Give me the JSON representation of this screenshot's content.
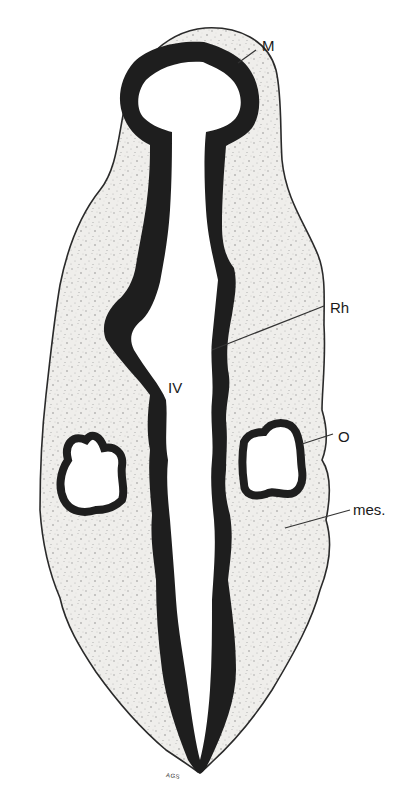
{
  "figure": {
    "type": "anatomical-diagram",
    "colors": {
      "background": "#ffffff",
      "mesenchyme_fill": "#ecebe8",
      "mesenchyme_speckle": "#9a9a9a",
      "neural_wall": "#1e1e1e",
      "outline": "#2a2a2a",
      "leader_line": "#333333"
    }
  },
  "labels": {
    "M": {
      "text": "M",
      "meaning": "mesencephalon"
    },
    "Rh": {
      "text": "Rh",
      "meaning": "rhombencephalon"
    },
    "IV": {
      "text": "IV",
      "meaning": "fourth ventricle"
    },
    "O": {
      "text": "O",
      "meaning": "otic vesicle"
    },
    "mes": {
      "text": "mes.",
      "meaning": "mesenchyme"
    }
  },
  "signature": "AGS"
}
